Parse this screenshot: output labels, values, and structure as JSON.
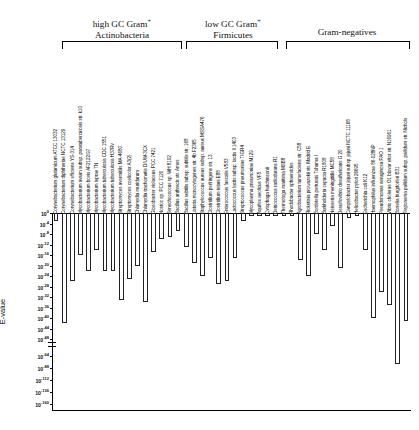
{
  "figure": {
    "ylabel": "E-value"
  },
  "groups": [
    {
      "title_line1": "high GC Gram",
      "title_sup": "+",
      "title_line2": "Actinobacteria"
    },
    {
      "title_line1": "low GC Gram",
      "title_sup": "+",
      "title_line2": "Firmicutes"
    },
    {
      "title_line1": "",
      "title_sup": "",
      "title_line2": "Gram-negatives"
    }
  ],
  "chart_data": {
    "type": "bar",
    "title": "",
    "xlabel": "",
    "ylabel": "E-value",
    "orientation": "downward",
    "yscale": "log-broken",
    "ylim": [
      0,
      -160
    ],
    "grid": false,
    "legend": null,
    "ytick_labels": [
      "10 0",
      "10 -4",
      "10 -8",
      "10 -12",
      "10 -16",
      "10 -20",
      "10 -24",
      "10 -28",
      "10 -32",
      "10 -36",
      "10 -40",
      "10 -44",
      "10 -48",
      "10 -64",
      "10 -88",
      "10 -112",
      "10 -136",
      "10 -160"
    ],
    "ytick_exponents": [
      0,
      -4,
      -8,
      -12,
      -16,
      -20,
      -24,
      -28,
      -32,
      -36,
      -40,
      -44,
      -48,
      -64,
      -88,
      -112,
      -136,
      -160
    ],
    "axis_break_after_exponent": -48,
    "categories": [
      "Corynebacterium glutamicum ATCC 13032",
      "Corynebacterium diphtheriae NCTC 13129",
      "Corynebacterium efficiens YS-314",
      "Mycobacterium avium subsp. paratuberculosis str. k10",
      "Mycobacterium bovis AF2122/97",
      "Mycobacterium leprae TN",
      "Mycobacterium tuberculosis CDC 1551",
      "Mycobacterium tuberculosis H37Rv",
      "Streptomyces avermitilis MA-4680",
      "Streptomyces coelicolor A3(2)",
      "Chlamydia muridarum",
      "Chlamydia trachomatis D/UW-3CX",
      "Gloeobacter violaceus PCC 7421",
      "Nostoc sp. PCC 7120",
      "Synechococcus sp. WH 8102",
      "Bacillus anthracis str. Ames",
      "Bacillus subtilis subsp. subtilis str. 168",
      "Listeria monocytogenes str. 4b F2365",
      "Staphylococcus aureus subsp. aureus MSSA476",
      "Clostridium perfringens str. 13",
      "Clostridium tetani E88",
      "Enterococcus faecalis V583",
      "Lactococcus lactis subsp. lactis Il 1403",
      "Streptococcus pneumoniae TIGR4",
      "Mycoplasma pneumoniae M129",
      "Aquifex aeolicus VF5",
      "Cytophaga hutchinsonii",
      "Deinococcus radiodurans R1",
      "Thermotoga maritima MSB8",
      "Rhodobacter sphaeroides",
      "Agrobacterium tumefaciens str. C58",
      "Rickettsia prowazekii str. Madrid E",
      "Bordetella pertussis Tohama I",
      "Burkholderia cepacia R1808",
      "Neisseria meningitidis MC58",
      "Desulfovibrio desulfuricans G 20",
      "Campylobacter jejuni subsp. jejuni NCTC 11168",
      "Helicobacter pylori 26695",
      "Escherichia coli K12",
      "Haemophilus influenzae 86-028NP",
      "Pseudomonas aeruginosa PAO 1",
      "Vibrio cholerae O1 biovar eltor str. N16961",
      "Borrelia burgdorferi B31",
      "Treponema pallidum subsp. pallidum str. Nichols"
    ],
    "values": [
      -3,
      -42,
      -26,
      -16,
      -22,
      -14,
      -22,
      -22,
      -33,
      -25,
      -20,
      -34,
      -15,
      -10,
      -9,
      -7,
      -13,
      -19,
      -24,
      -17,
      -27,
      -26,
      -17,
      -3,
      -1,
      -1,
      -1,
      -1,
      -1,
      -1,
      -18,
      -24,
      -8,
      -14,
      -5,
      -21,
      -2,
      -1,
      -14,
      -40,
      -30,
      -35,
      -80,
      -41
    ],
    "group_ranges": [
      {
        "group": "high GC Gram+ / Actinobacteria",
        "start_index": 0,
        "end_index": 9
      },
      {
        "group": "low GC Gram+ / Firmicutes",
        "start_index": 15,
        "end_index": 24
      },
      {
        "group": "Gram-negatives",
        "start_index": 29,
        "end_index": 43
      }
    ]
  }
}
